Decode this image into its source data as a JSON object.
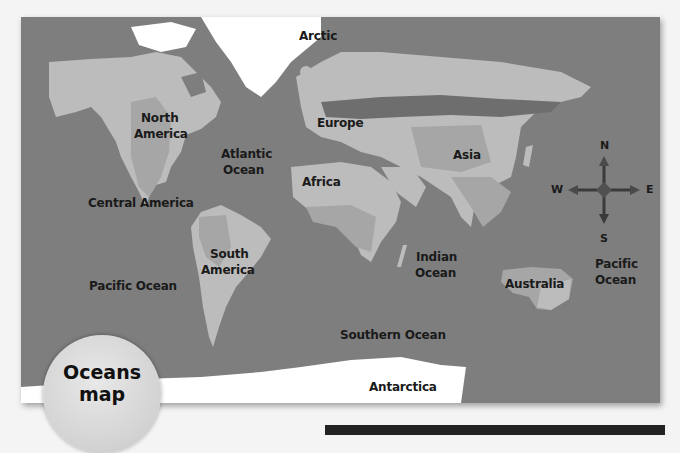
{
  "badge": {
    "line1": "Oceans",
    "line2": "map"
  },
  "continents": {
    "north_america_1": "North",
    "north_america_2": "America",
    "south_america_1": "South",
    "south_america_2": "America",
    "europe": "Europe",
    "africa": "Africa",
    "asia": "Asia",
    "australia": "Australia",
    "antarctica": "Antarctica",
    "central_america": "Central America"
  },
  "oceans": {
    "arctic": "Arctic",
    "atlantic_1": "Atlantic",
    "atlantic_2": "Ocean",
    "pacific_west": "Pacific Ocean",
    "pacific_east_1": "Pacific",
    "pacific_east_2": "Ocean",
    "indian_1": "Indian",
    "indian_2": "Ocean",
    "southern": "Southern Ocean"
  },
  "compass": {
    "north": "N",
    "south": "S",
    "east": "E",
    "west": "W"
  },
  "colors": {
    "ocean": "#7e7e7e",
    "land": "#bcbcbc",
    "land_dark": "#a6a6a6",
    "forest_band": "#6e6e6e",
    "ice": "#ffffff"
  }
}
